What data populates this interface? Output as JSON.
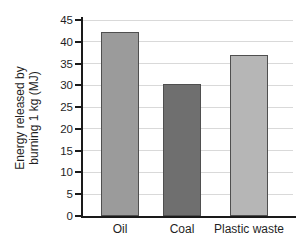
{
  "chart_data": {
    "type": "bar",
    "categories": [
      "Oil",
      "Coal",
      "Plastic waste"
    ],
    "values": [
      42.3,
      30.2,
      36.9
    ],
    "title": "",
    "xlabel": "",
    "ylabel": "Energy released by burning 1 kg (MJ)",
    "ylabel_lines": [
      "Energy released by",
      "burning 1 kg (MJ)"
    ],
    "ylim": [
      0,
      45
    ],
    "yticks": [
      0,
      5,
      10,
      15,
      20,
      25,
      30,
      35,
      40,
      45
    ],
    "grid": true,
    "legend_position": "none",
    "bar_colors": [
      "#9b9b9b",
      "#6f6f6f",
      "#b6b6b6"
    ],
    "bar_border_color": "#4f4f4f",
    "axis_color": "#1a1a1a",
    "grid_color": "#d9d9d9",
    "background_color": "#ffffff"
  }
}
